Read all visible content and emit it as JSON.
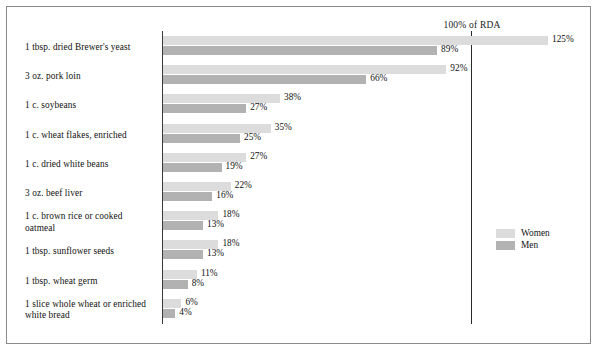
{
  "chart_data": {
    "type": "bar",
    "orientation": "horizontal",
    "title": "",
    "subtitle": "",
    "xlabel": "",
    "ylabel": "",
    "xlim": [
      0,
      130
    ],
    "grid": false,
    "value_suffix": "%",
    "reference_line": {
      "label": "100% of RDA",
      "value": 100
    },
    "legend": {
      "position": "bottom-right",
      "entries": [
        {
          "name": "Women",
          "color": "#dcdcdc"
        },
        {
          "name": "Men",
          "color": "#b2b2b2"
        }
      ]
    },
    "categories": [
      "1 tbsp. dried Brewer's yeast",
      "3 oz. pork loin",
      "1 c. soybeans",
      "1 c. wheat flakes, enriched",
      "1 c. dried white beans",
      "3 oz. beef liver",
      "1 c. brown rice or cooked oatmeal",
      "1 tbsp. sunflower seeds",
      "1 tbsp. wheat germ",
      "1 slice whole wheat or enriched white bread"
    ],
    "series": [
      {
        "name": "Women",
        "color": "#dcdcdc",
        "values": [
          125,
          92,
          38,
          35,
          27,
          22,
          18,
          18,
          11,
          6
        ],
        "labels": [
          "125%",
          "92%",
          "38%",
          "35%",
          "27%",
          "22%",
          "18%",
          "18%",
          "11%",
          "6%"
        ]
      },
      {
        "name": "Men",
        "color": "#b2b2b2",
        "values": [
          89,
          66,
          27,
          25,
          19,
          16,
          13,
          13,
          8,
          4
        ],
        "labels": [
          "89%",
          "66%",
          "27%",
          "25%",
          "19%",
          "16%",
          "13%",
          "13%",
          "8%",
          "4%"
        ]
      }
    ]
  },
  "rows": [
    {
      "label": "1 tbsp. dried Brewer's yeast",
      "lines": [
        "1 tbsp. dried Brewer's yeast"
      ],
      "women": 125,
      "men": 89,
      "women_label": "125%",
      "men_label": "89%"
    },
    {
      "label": "3 oz. pork loin",
      "lines": [
        "3 oz. pork loin"
      ],
      "women": 92,
      "men": 66,
      "women_label": "92%",
      "men_label": "66%"
    },
    {
      "label": "1 c. soybeans",
      "lines": [
        "1 c. soybeans"
      ],
      "women": 38,
      "men": 27,
      "women_label": "38%",
      "men_label": "27%"
    },
    {
      "label": "1 c. wheat flakes, enriched",
      "lines": [
        "1 c. wheat flakes, enriched"
      ],
      "women": 35,
      "men": 25,
      "women_label": "35%",
      "men_label": "25%"
    },
    {
      "label": "1 c. dried white beans",
      "lines": [
        "1 c. dried white beans"
      ],
      "women": 27,
      "men": 19,
      "women_label": "27%",
      "men_label": "19%"
    },
    {
      "label": "3 oz. beef liver",
      "lines": [
        "3 oz. beef liver"
      ],
      "women": 22,
      "men": 16,
      "women_label": "22%",
      "men_label": "16%"
    },
    {
      "label": "1 c. brown rice or cooked oatmeal",
      "lines": [
        "1 c. brown rice or cooked",
        "oatmeal"
      ],
      "women": 18,
      "men": 13,
      "women_label": "18%",
      "men_label": "13%"
    },
    {
      "label": "1 tbsp. sunflower seeds",
      "lines": [
        "1 tbsp. sunflower seeds"
      ],
      "women": 18,
      "men": 13,
      "women_label": "18%",
      "men_label": "13%"
    },
    {
      "label": "1 tbsp. wheat germ",
      "lines": [
        "1 tbsp. wheat germ"
      ],
      "women": 11,
      "men": 8,
      "women_label": "11%",
      "men_label": "8%"
    },
    {
      "label": "1 slice whole wheat or enriched white bread",
      "lines": [
        "1 slice whole wheat or enriched",
        "white bread"
      ],
      "women": 6,
      "men": 4,
      "women_label": "6%",
      "men_label": "4%"
    }
  ],
  "reference": {
    "label": "100% of RDA"
  },
  "legend": {
    "women_label": "Women",
    "men_label": "Men",
    "women_color": "#dcdcdc",
    "men_color": "#b2b2b2"
  }
}
